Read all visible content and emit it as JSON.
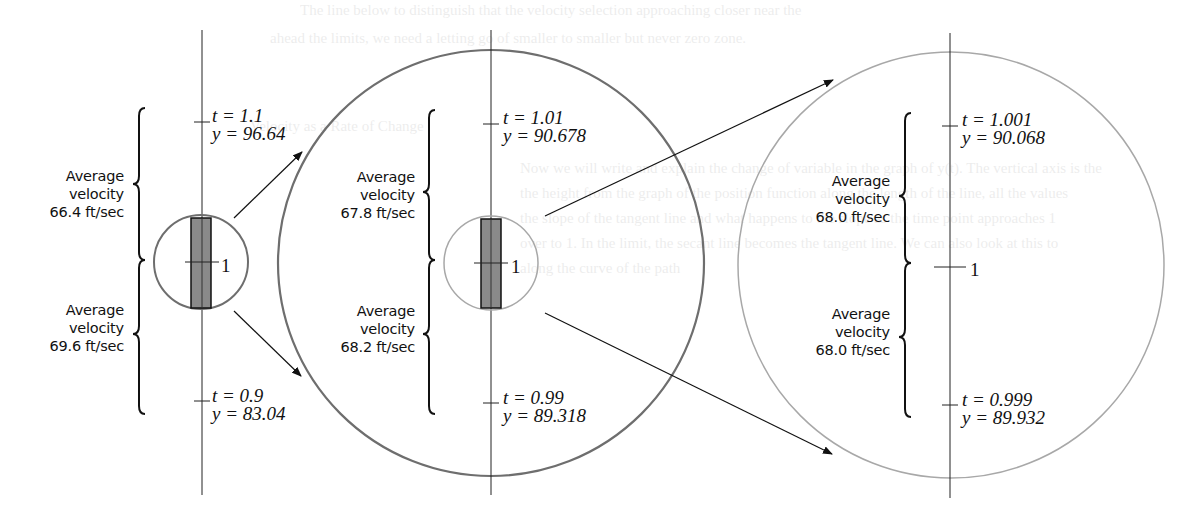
{
  "figure": {
    "colors": {
      "ink": "#111111",
      "circle_dark": "#6e6e6e",
      "circle_light": "#a8a8a8",
      "rect_fill": "#8a8a8a"
    },
    "panels": [
      {
        "id": "zoom-1",
        "axis_x": 202,
        "upper": {
          "t_label": "t = 1.1",
          "y_label": "y = 96.64",
          "t": 1.1,
          "y": 96.64
        },
        "center": {
          "label": "1",
          "t": 1
        },
        "lower": {
          "t_label": "t = 0.9",
          "y_label": "y = 83.04",
          "t": 0.9,
          "y": 83.04
        },
        "avg_upper": {
          "line1": "Average",
          "line2": "velocity",
          "line3": "66.4 ft/sec",
          "value": 66.4
        },
        "avg_lower": {
          "line1": "Average",
          "line2": "velocity",
          "line3": "69.6 ft/sec",
          "value": 69.6
        }
      },
      {
        "id": "zoom-2",
        "axis_x": 491,
        "upper": {
          "t_label": "t = 1.01",
          "y_label": "y = 90.678",
          "t": 1.01,
          "y": 90.678
        },
        "center": {
          "label": "1",
          "t": 1
        },
        "lower": {
          "t_label": "t = 0.99",
          "y_label": "y = 89.318",
          "t": 0.99,
          "y": 89.318
        },
        "avg_upper": {
          "line1": "Average",
          "line2": "velocity",
          "line3": "67.8 ft/sec",
          "value": 67.8
        },
        "avg_lower": {
          "line1": "Average",
          "line2": "velocity",
          "line3": "68.2 ft/sec",
          "value": 68.2
        }
      },
      {
        "id": "zoom-3",
        "axis_x": 950,
        "upper": {
          "t_label": "t = 1.001",
          "y_label": "y = 90.068",
          "t": 1.001,
          "y": 90.068
        },
        "center": {
          "label": "1",
          "t": 1
        },
        "lower": {
          "t_label": "t = 0.999",
          "y_label": "y = 89.932",
          "t": 0.999,
          "y": 89.932
        },
        "avg_upper": {
          "line1": "Average",
          "line2": "velocity",
          "line3": "68.0 ft/sec",
          "value": 68.0
        },
        "avg_lower": {
          "line1": "Average",
          "line2": "velocity",
          "line3": "68.0 ft/sec",
          "value": 68.0
        }
      }
    ],
    "bleed_through_text": [
      "The line below to distinguish that the velocity selection approaching closer near the",
      "ahead the limits, we need a letting go of smaller to smaller but never zero zone.",
      "Velocity as a Rate of Change",
      "Now we will write and explain the change of variable in the graph of y(t). The vertical axis is the",
      "the height from the graph of the position function along the length of the line, all the values",
      "the slope of the tangent line and what happens to the slope as the time point approaches 1",
      "over to 1. In the limit, the secant line becomes the tangent line. We can also look at this to",
      "along the curve of the path"
    ]
  }
}
